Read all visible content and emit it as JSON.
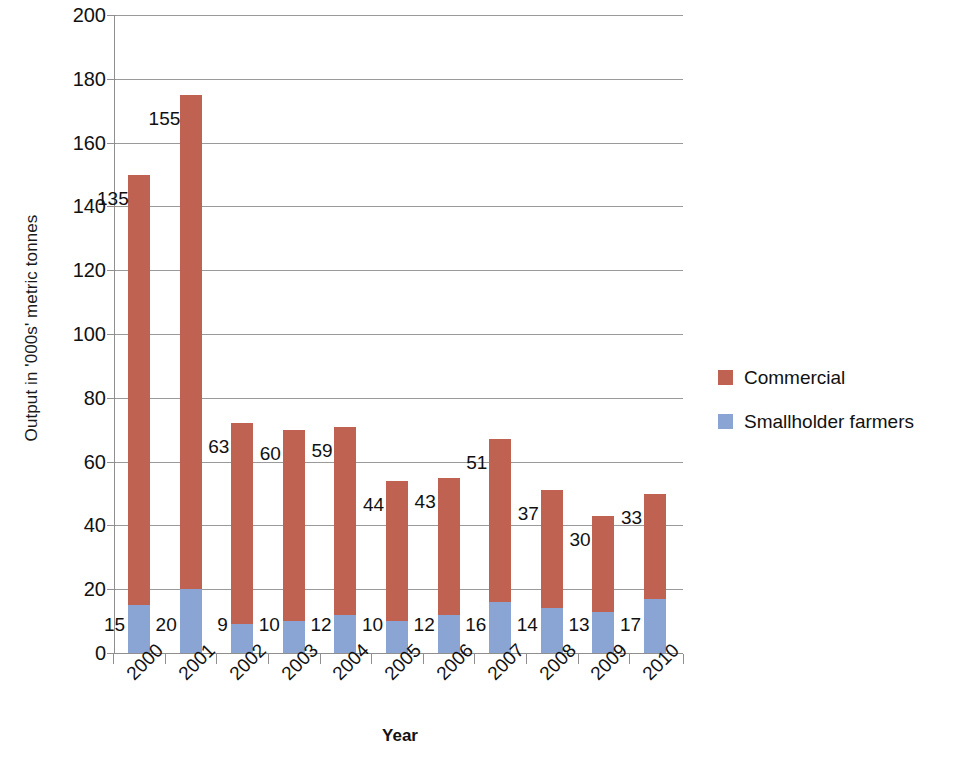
{
  "chart_data": {
    "type": "bar",
    "subtype": "stacked-vertical",
    "title": "",
    "xlabel": "Year",
    "ylabel": "Output in '000s' metric tonnes",
    "categories": [
      "2000",
      "2001",
      "2002",
      "2003",
      "2004",
      "2005",
      "2006",
      "2007",
      "2008",
      "2009",
      "2010"
    ],
    "series": [
      {
        "name": "Smallholder farmers",
        "color": "#8aa4d3",
        "values": [
          15,
          20,
          9,
          10,
          12,
          10,
          12,
          16,
          14,
          13,
          17
        ]
      },
      {
        "name": "Commercial",
        "color": "#bf6251",
        "values": [
          135,
          155,
          63,
          60,
          59,
          44,
          43,
          51,
          37,
          30,
          33
        ]
      }
    ],
    "totals": [
      150,
      175,
      72,
      70,
      71,
      54,
      55,
      67,
      51,
      43,
      50
    ],
    "ylim": [
      0,
      200
    ],
    "ytick_step": 20,
    "yticks": [
      "200",
      "180",
      "160",
      "140",
      "120",
      "100",
      "80",
      "60",
      "40",
      "20",
      "0"
    ],
    "ytick_values": [
      200,
      180,
      160,
      140,
      120,
      100,
      80,
      60,
      40,
      20,
      0
    ],
    "grid": "horizontal",
    "legend_position": "right",
    "stack_order": [
      "Smallholder farmers",
      "Commercial"
    ]
  },
  "axes": {
    "y_title": "Output in '000s' metric tonnes",
    "x_title": "Year"
  },
  "legend": {
    "items": [
      {
        "label": "Commercial",
        "color": "#bf6251"
      },
      {
        "label": "Smallholder farmers",
        "color": "#8aa4d3"
      }
    ]
  },
  "colors": {
    "commercial": "#bf6251",
    "smallholder": "#8aa4d3",
    "grid": "#9a9a9a",
    "axis": "#8f8f8f",
    "text": "#111111",
    "background": "#ffffff"
  }
}
